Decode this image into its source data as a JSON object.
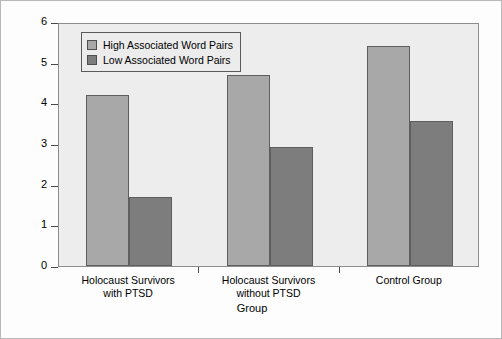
{
  "chart_data": {
    "type": "bar",
    "title": "",
    "xlabel": "Group",
    "ylabel": "Recall Performance",
    "ylim": [
      0,
      6
    ],
    "yticks": [
      "0",
      "1",
      "2",
      "3",
      "4",
      "5",
      "6"
    ],
    "grid": false,
    "legend_position": "top-left inside plot",
    "categories": [
      "Holocaust Survivors with PTSD",
      "Holocaust Survivors without PTSD",
      "Control Group"
    ],
    "category_lines": [
      [
        "Holocaust Survivors",
        "with PTSD"
      ],
      [
        "Holocaust Survivors",
        "without PTSD"
      ],
      [
        "Control Group",
        ""
      ]
    ],
    "series": [
      {
        "name": "High Associated Word Pairs",
        "color": "#a8a8a8",
        "values": [
          4.2,
          4.7,
          5.4
        ]
      },
      {
        "name": "Low Associated Word Pairs",
        "color": "#7d7d7d",
        "values": [
          1.7,
          2.93,
          3.57
        ]
      }
    ]
  },
  "legend": {
    "items": [
      {
        "label": "High Associated Word Pairs",
        "swatch": "high"
      },
      {
        "label": "Low Associated Word Pairs",
        "swatch": "low"
      }
    ]
  },
  "colors": {
    "high_bar": "#a8a8a8",
    "low_bar": "#7d7d7d",
    "plot_background": "#ededed",
    "figure_background": "#fdfdfd",
    "axis": "#4a4a4a"
  }
}
